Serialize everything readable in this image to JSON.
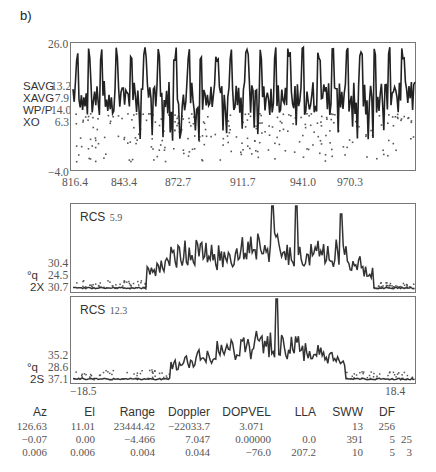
{
  "panel_label": "b)",
  "top_plot": {
    "y_max": "26.0",
    "y_min": "−4.0",
    "legend": [
      {
        "name": "SAVG",
        "value": "13.2"
      },
      {
        "name": "XAVG",
        "value": "7.9"
      },
      {
        "name": "WP/P",
        "value": "14.0"
      },
      {
        "name": "XO",
        "value": "6.3"
      }
    ],
    "x_ticks": [
      "816.4",
      "843.4",
      "872.7",
      "911.7",
      "941.0",
      "970.3"
    ]
  },
  "mid_plot": {
    "title": "RCS",
    "title_value": "5.9",
    "side_labels": [
      {
        "name": "",
        "value": "30.4"
      },
      {
        "name": "°q",
        "value": "24.5"
      },
      {
        "name": "2X",
        "value": "30.7"
      }
    ]
  },
  "bot_plot": {
    "title": "RCS",
    "title_value": "12.3",
    "side_labels": [
      {
        "name": "",
        "value": "35.2"
      },
      {
        "name": "°q",
        "value": "28.6"
      },
      {
        "name": "2S",
        "value": "37.1"
      }
    ],
    "x_left": "−18.5",
    "x_right": "18.4"
  },
  "table": {
    "headers": [
      "Az",
      "El",
      "Range",
      "Doppler",
      "DOPVEL",
      "LLA",
      "SWW",
      "DF",
      ""
    ],
    "rows": [
      [
        "126.63",
        "11.01",
        "23444.42",
        "−22033.7",
        "3.071",
        "",
        "13",
        "256",
        ""
      ],
      [
        "−0.07",
        "0.00",
        "−4.466",
        "7.047",
        "0.00000",
        "0.0",
        "391",
        "5",
        "25"
      ],
      [
        "0.006",
        "0.006",
        "0.004",
        "0.044",
        "−76.0",
        "207.2",
        "10",
        "5",
        "3"
      ]
    ]
  },
  "chart_data": [
    {
      "type": "line",
      "title": "",
      "xlabel": "",
      "ylabel": "",
      "ylim": [
        -4.0,
        26.0
      ],
      "x_ticks": [
        "816.4",
        "843.4",
        "872.7",
        "911.7",
        "941.0",
        "970.3"
      ],
      "legend": [
        {
          "name": "SAVG",
          "value": 13.2
        },
        {
          "name": "XAVG",
          "value": 7.9
        },
        {
          "name": "WP/P",
          "value": 14.0
        },
        {
          "name": "XO",
          "value": 6.3
        }
      ],
      "description": "Noisy time series oscillating around ~12-14 with periodic sharp spikes reaching ~24-26, plus scattered dots below between ~0 and ~10",
      "spike_positions_x_approx": [
        819,
        826,
        834,
        844,
        852,
        862,
        870,
        880,
        889,
        897,
        906,
        915,
        923,
        932,
        940,
        950,
        958,
        966,
        975
      ]
    },
    {
      "type": "line",
      "title": "RCS 5.9",
      "side_values": {
        "top": 30.4,
        "q": 24.5,
        "2X": 30.7
      },
      "description": "Flat noise floor on the left third, then a three-lobed envelope of rapid oscillations peaking near the center-right, returning to floor on the right"
    },
    {
      "type": "line",
      "title": "RCS 12.3",
      "side_values": {
        "top": 35.2,
        "q": 28.6,
        "2S": 37.1
      },
      "xlim": [
        -18.5,
        18.4
      ],
      "description": "Flat noise floor, rising oscillating envelope to a central peak slightly right of center, then decaying to floor"
    }
  ]
}
